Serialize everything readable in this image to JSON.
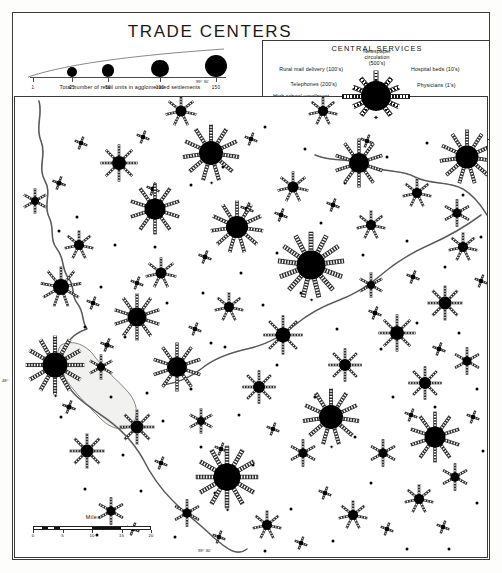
{
  "title": "TRADE CENTERS",
  "size_legend": {
    "caption": "Total number of retail units in agglomerated settlements",
    "ticks": [
      {
        "value": "1",
        "x": 3,
        "r": 1.2
      },
      {
        "value": "25",
        "x": 42,
        "r": 5.0
      },
      {
        "value": "50",
        "x": 78,
        "r": 6.4
      },
      {
        "value": "100",
        "x": 130,
        "r": 8.6
      },
      {
        "value": "150",
        "x": 186,
        "r": 11.2
      }
    ]
  },
  "central_services": {
    "title": "CENTRAL SERVICES",
    "county_seat_label": "County seat",
    "county_seat_glyph": "✦",
    "spokes": [
      {
        "label": "Newspaper\ncirculation\n(500's)",
        "angle": -90,
        "side": "c",
        "len": 26,
        "lx": 0,
        "ly": -48
      },
      {
        "label": "Hospital beds (10's)",
        "angle": -50,
        "side": "r",
        "len": 24,
        "lx": 34,
        "ly": -30
      },
      {
        "label": "Physicians (1's)",
        "angle": -22,
        "side": "r",
        "len": 25,
        "lx": 40,
        "ly": -14
      },
      {
        "label": "Dentists (1's)",
        "angle": 0,
        "side": "r",
        "len": 34,
        "lx": 48,
        "ly": -1
      },
      {
        "label": "Veterinarians( 1's)",
        "angle": 24,
        "side": "r",
        "len": 25,
        "lx": 40,
        "ly": 13
      },
      {
        "label": "Lawyers (1's)",
        "angle": 52,
        "side": "r",
        "len": 24,
        "lx": 32,
        "ly": 28
      },
      {
        "label": "Hotel rooms ( 10's)",
        "angle": 128,
        "side": "l",
        "len": 24,
        "lx": -31,
        "ly": 28
      },
      {
        "label": "Bank assets  ($ million)",
        "angle": 156,
        "side": "l",
        "len": 25,
        "lx": -40,
        "ly": 13
      },
      {
        "label": "High school enrollment\n(50's)",
        "angle": 180,
        "side": "l",
        "len": 34,
        "lx": -48,
        "ly": -3
      },
      {
        "label": "Telephones (200's)",
        "angle": 202,
        "side": "l",
        "len": 25,
        "lx": -40,
        "ly": -15
      },
      {
        "label": "Rural mail delivery (100's)",
        "angle": 230,
        "side": "l",
        "len": 24,
        "lx": -34,
        "ly": -30
      }
    ]
  },
  "miles_scale": {
    "label": "Miles",
    "ticks": [
      "0",
      "5",
      "10",
      "15",
      "20"
    ]
  },
  "graticule": [
    {
      "text": "99° 30'",
      "x": 196,
      "y": 79
    },
    {
      "text": "48°",
      "x": 2,
      "y": 378
    },
    {
      "text": "99° 30'",
      "x": 198,
      "y": 548
    }
  ],
  "map": {
    "rivers": [
      "M 24 4 C 28 18 20 30 26 44 C 32 58 22 70 30 84 C 37 96 28 108 34 120 C 40 132 34 142 42 152 C 50 162 46 172 54 182 C 60 190 56 198 62 206 C 70 216 66 224 72 232 C 52 238 44 256 48 276 C 52 296 70 306 86 318 C 104 330 118 344 128 362 C 136 378 146 392 158 404 C 172 418 186 428 198 440 C 212 452 222 460 232 452",
      "M 300 58 C 318 66 336 60 352 68 C 368 76 386 72 400 80 C 416 88 434 84 448 92 C 458 98 466 108 472 118",
      "M 466 118 C 450 130 432 140 414 148 C 396 156 380 166 366 178 C 352 190 338 198 322 204 C 306 210 292 218 280 228 C 266 240 250 248 232 252 C 214 256 198 262 186 272 C 176 280 162 286 148 288"
    ],
    "lakes": [
      "M 46 248 C 58 242 72 248 80 260 C 90 274 104 284 114 296 C 122 306 124 318 118 326 C 110 336 96 332 86 322 C 72 308 58 294 48 278 C 42 268 40 256 46 248 Z"
    ]
  },
  "symbols": [
    {
      "x": 196,
      "y": 56,
      "r": 12.0,
      "spokes": 11,
      "seat": true
    },
    {
      "x": 140,
      "y": 112,
      "r": 10.5,
      "spokes": 10,
      "seat": false
    },
    {
      "x": 296,
      "y": 168,
      "r": 14.5,
      "spokes": 13,
      "seat": true
    },
    {
      "x": 40,
      "y": 268,
      "r": 12.5,
      "spokes": 12,
      "seat": true
    },
    {
      "x": 316,
      "y": 320,
      "r": 12.0,
      "spokes": 11,
      "seat": true
    },
    {
      "x": 212,
      "y": 380,
      "r": 13.5,
      "spokes": 12,
      "seat": true
    },
    {
      "x": 420,
      "y": 340,
      "r": 10.5,
      "spokes": 10,
      "seat": false
    },
    {
      "x": 122,
      "y": 220,
      "r": 9.5,
      "spokes": 10,
      "seat": false
    },
    {
      "x": 162,
      "y": 270,
      "r": 10.0,
      "spokes": 10,
      "seat": false
    },
    {
      "x": 222,
      "y": 130,
      "r": 11.0,
      "spokes": 11,
      "seat": false
    },
    {
      "x": 344,
      "y": 66,
      "r": 10.0,
      "spokes": 10,
      "seat": false
    },
    {
      "x": 452,
      "y": 60,
      "r": 11.5,
      "spokes": 11,
      "seat": false
    },
    {
      "x": 46,
      "y": 190,
      "r": 8.0,
      "spokes": 9,
      "seat": false
    },
    {
      "x": 104,
      "y": 66,
      "r": 7.0,
      "spokes": 8,
      "seat": false
    },
    {
      "x": 268,
      "y": 238,
      "r": 7.5,
      "spokes": 8,
      "seat": false
    },
    {
      "x": 382,
      "y": 236,
      "r": 7.0,
      "spokes": 8,
      "seat": false
    },
    {
      "x": 122,
      "y": 330,
      "r": 6.5,
      "spokes": 8,
      "seat": false
    },
    {
      "x": 72,
      "y": 354,
      "r": 6.5,
      "spokes": 8,
      "seat": false
    },
    {
      "x": 244,
      "y": 290,
      "r": 6.0,
      "spokes": 8,
      "seat": false
    },
    {
      "x": 330,
      "y": 268,
      "r": 6.0,
      "spokes": 8,
      "seat": false
    },
    {
      "x": 410,
      "y": 286,
      "r": 6.0,
      "spokes": 8,
      "seat": false
    },
    {
      "x": 430,
      "y": 206,
      "r": 6.5,
      "spokes": 8,
      "seat": false
    },
    {
      "x": 146,
      "y": 176,
      "r": 5.5,
      "spokes": 7,
      "seat": false
    },
    {
      "x": 64,
      "y": 148,
      "r": 5.0,
      "spokes": 7,
      "seat": false
    },
    {
      "x": 214,
      "y": 210,
      "r": 5.0,
      "spokes": 7,
      "seat": false
    },
    {
      "x": 356,
      "y": 128,
      "r": 5.0,
      "spokes": 7,
      "seat": false
    },
    {
      "x": 278,
      "y": 90,
      "r": 5.5,
      "spokes": 7,
      "seat": false
    },
    {
      "x": 402,
      "y": 96,
      "r": 5.0,
      "spokes": 7,
      "seat": false
    },
    {
      "x": 448,
      "y": 150,
      "r": 5.0,
      "spokes": 7,
      "seat": false
    },
    {
      "x": 166,
      "y": 14,
      "r": 5.5,
      "spokes": 7,
      "seat": false
    },
    {
      "x": 308,
      "y": 14,
      "r": 5.0,
      "spokes": 7,
      "seat": false
    },
    {
      "x": 404,
      "y": 402,
      "r": 5.0,
      "spokes": 7,
      "seat": false
    },
    {
      "x": 338,
      "y": 418,
      "r": 5.0,
      "spokes": 7,
      "seat": false
    },
    {
      "x": 252,
      "y": 428,
      "r": 5.0,
      "spokes": 7,
      "seat": false
    },
    {
      "x": 172,
      "y": 416,
      "r": 4.5,
      "spokes": 6,
      "seat": false
    },
    {
      "x": 96,
      "y": 414,
      "r": 4.5,
      "spokes": 6,
      "seat": false
    },
    {
      "x": 288,
      "y": 356,
      "r": 4.5,
      "spokes": 6,
      "seat": false
    },
    {
      "x": 368,
      "y": 356,
      "r": 4.5,
      "spokes": 6,
      "seat": false
    },
    {
      "x": 440,
      "y": 380,
      "r": 4.5,
      "spokes": 6,
      "seat": false
    },
    {
      "x": 452,
      "y": 264,
      "r": 4.5,
      "spokes": 6,
      "seat": false
    },
    {
      "x": 442,
      "y": 116,
      "r": 4.5,
      "spokes": 6,
      "seat": false
    },
    {
      "x": 20,
      "y": 104,
      "r": 4.0,
      "spokes": 6,
      "seat": false
    },
    {
      "x": 86,
      "y": 270,
      "r": 4.0,
      "spokes": 6,
      "seat": false
    },
    {
      "x": 186,
      "y": 324,
      "r": 4.0,
      "spokes": 6,
      "seat": false
    },
    {
      "x": 356,
      "y": 188,
      "r": 4.0,
      "spokes": 6,
      "seat": false
    }
  ],
  "small_symbols": [
    {
      "x": 44,
      "y": 86,
      "r": 2.6
    },
    {
      "x": 92,
      "y": 248,
      "r": 2.6
    },
    {
      "x": 54,
      "y": 310,
      "r": 2.6
    },
    {
      "x": 138,
      "y": 92,
      "r": 2.4
    },
    {
      "x": 190,
      "y": 160,
      "r": 2.4
    },
    {
      "x": 232,
      "y": 112,
      "r": 2.4
    },
    {
      "x": 266,
      "y": 118,
      "r": 2.4
    },
    {
      "x": 318,
      "y": 108,
      "r": 2.4
    },
    {
      "x": 360,
      "y": 216,
      "r": 2.4
    },
    {
      "x": 398,
      "y": 180,
      "r": 2.4
    },
    {
      "x": 424,
      "y": 252,
      "r": 2.4
    },
    {
      "x": 180,
      "y": 232,
      "r": 2.2
    },
    {
      "x": 122,
      "y": 186,
      "r": 2.2
    },
    {
      "x": 78,
      "y": 206,
      "r": 2.2
    },
    {
      "x": 258,
      "y": 332,
      "r": 2.2
    },
    {
      "x": 206,
      "y": 352,
      "r": 2.2
    },
    {
      "x": 146,
      "y": 366,
      "r": 2.2
    },
    {
      "x": 310,
      "y": 396,
      "r": 2.2
    },
    {
      "x": 372,
      "y": 432,
      "r": 2.2
    },
    {
      "x": 286,
      "y": 446,
      "r": 2.2
    },
    {
      "x": 204,
      "y": 440,
      "r": 2.2
    },
    {
      "x": 118,
      "y": 432,
      "r": 2.2
    },
    {
      "x": 428,
      "y": 430,
      "r": 2.2
    },
    {
      "x": 458,
      "y": 320,
      "r": 2.2
    },
    {
      "x": 466,
      "y": 184,
      "r": 2.2
    },
    {
      "x": 352,
      "y": 44,
      "r": 2.2
    },
    {
      "x": 236,
      "y": 42,
      "r": 2.2
    },
    {
      "x": 128,
      "y": 40,
      "r": 2.2
    },
    {
      "x": 66,
      "y": 46,
      "r": 2.2
    },
    {
      "x": 396,
      "y": 318,
      "r": 2.2
    }
  ],
  "dots": [
    {
      "x": 62,
      "y": 120
    },
    {
      "x": 100,
      "y": 148
    },
    {
      "x": 86,
      "y": 190
    },
    {
      "x": 140,
      "y": 150
    },
    {
      "x": 176,
      "y": 88
    },
    {
      "x": 208,
      "y": 70
    },
    {
      "x": 250,
      "y": 30
    },
    {
      "x": 290,
      "y": 52
    },
    {
      "x": 330,
      "y": 86
    },
    {
      "x": 372,
      "y": 60
    },
    {
      "x": 412,
      "y": 46
    },
    {
      "x": 448,
      "y": 98
    },
    {
      "x": 466,
      "y": 140
    },
    {
      "x": 430,
      "y": 170
    },
    {
      "x": 392,
      "y": 144
    },
    {
      "x": 348,
      "y": 158
    },
    {
      "x": 306,
      "y": 126
    },
    {
      "x": 262,
      "y": 156
    },
    {
      "x": 226,
      "y": 176
    },
    {
      "x": 188,
      "y": 196
    },
    {
      "x": 152,
      "y": 206
    },
    {
      "x": 110,
      "y": 240
    },
    {
      "x": 70,
      "y": 230
    },
    {
      "x": 46,
      "y": 320
    },
    {
      "x": 96,
      "y": 300
    },
    {
      "x": 132,
      "y": 296
    },
    {
      "x": 176,
      "y": 292
    },
    {
      "x": 210,
      "y": 250
    },
    {
      "x": 248,
      "y": 208
    },
    {
      "x": 286,
      "y": 196
    },
    {
      "x": 322,
      "y": 232
    },
    {
      "x": 366,
      "y": 252
    },
    {
      "x": 402,
      "y": 226
    },
    {
      "x": 444,
      "y": 236
    },
    {
      "x": 462,
      "y": 292
    },
    {
      "x": 420,
      "y": 310
    },
    {
      "x": 378,
      "y": 300
    },
    {
      "x": 340,
      "y": 340
    },
    {
      "x": 300,
      "y": 300
    },
    {
      "x": 262,
      "y": 268
    },
    {
      "x": 224,
      "y": 318
    },
    {
      "x": 186,
      "y": 350
    },
    {
      "x": 148,
      "y": 324
    },
    {
      "x": 108,
      "y": 358
    },
    {
      "x": 70,
      "y": 392
    },
    {
      "x": 126,
      "y": 394
    },
    {
      "x": 160,
      "y": 440
    },
    {
      "x": 200,
      "y": 396
    },
    {
      "x": 238,
      "y": 368
    },
    {
      "x": 276,
      "y": 412
    },
    {
      "x": 318,
      "y": 444
    },
    {
      "x": 356,
      "y": 386
    },
    {
      "x": 392,
      "y": 452
    },
    {
      "x": 434,
      "y": 452
    },
    {
      "x": 462,
      "y": 406
    },
    {
      "x": 468,
      "y": 354
    },
    {
      "x": 250,
      "y": 454
    },
    {
      "x": 82,
      "y": 438
    },
    {
      "x": 44,
      "y": 134
    },
    {
      "x": 196,
      "y": 246
    }
  ]
}
